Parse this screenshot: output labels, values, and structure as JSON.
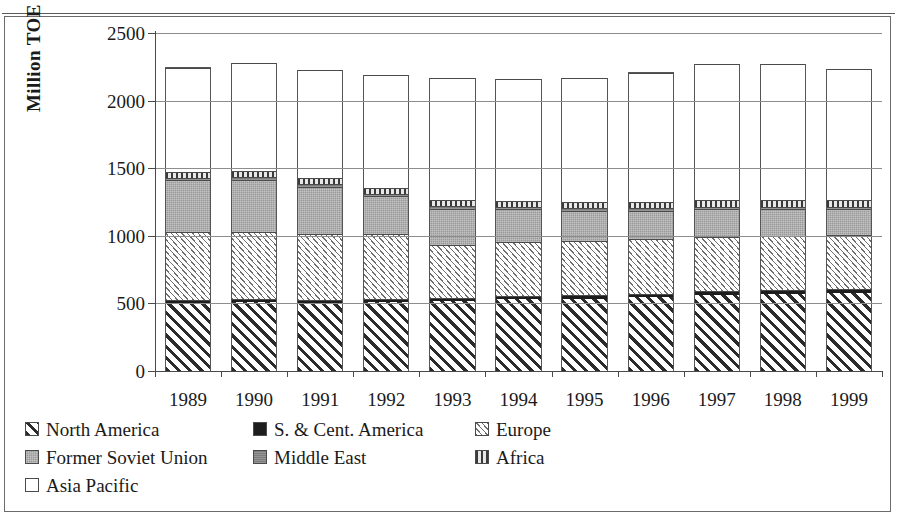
{
  "chart_data": {
    "type": "bar",
    "subtype": "stacked-vertical",
    "title": "",
    "xlabel": "",
    "ylabel": "Million TOE",
    "ylim": [
      0,
      2500
    ],
    "yticks": [
      0,
      500,
      1000,
      1500,
      2000,
      2500
    ],
    "grid": true,
    "legend_position": "bottom-left",
    "categories": [
      "1989",
      "1990",
      "1991",
      "1992",
      "1993",
      "1994",
      "1995",
      "1996",
      "1997",
      "1998",
      "1999"
    ],
    "series": [
      {
        "name": "North America",
        "key": "na",
        "pattern": "diagonal-hatch",
        "values": [
          505,
          512,
          505,
          512,
          515,
          530,
          535,
          545,
          562,
          572,
          580
        ]
      },
      {
        "name": "S. & Cent. America",
        "key": "sca",
        "pattern": "solid-black",
        "values": [
          22,
          22,
          22,
          24,
          24,
          25,
          26,
          27,
          28,
          28,
          28
        ]
      },
      {
        "name": "Europe",
        "key": "eur",
        "pattern": "fine-hatch",
        "values": [
          500,
          495,
          490,
          480,
          395,
          400,
          400,
          405,
          400,
          400,
          395
        ]
      },
      {
        "name": "Former Soviet Union",
        "key": "fsu",
        "pattern": "gray-stipple",
        "values": [
          385,
          385,
          345,
          275,
          265,
          240,
          225,
          210,
          205,
          195,
          195
        ]
      },
      {
        "name": "Middle East",
        "key": "me",
        "pattern": "medium-gray",
        "values": [
          18,
          18,
          18,
          18,
          18,
          18,
          18,
          18,
          18,
          18,
          18
        ]
      },
      {
        "name": "Africa",
        "key": "afr",
        "pattern": "vertical-stripe",
        "values": [
          45,
          48,
          45,
          42,
          45,
          45,
          45,
          48,
          50,
          50,
          52
        ]
      },
      {
        "name": "Asia Pacific",
        "key": "ap",
        "pattern": "white-empty",
        "values": [
          770,
          795,
          805,
          835,
          905,
          900,
          915,
          955,
          1010,
          1010,
          965
        ]
      }
    ],
    "totals": [
      2245,
      2275,
      2230,
      2186,
      2167,
      2158,
      2164,
      2208,
      2273,
      2273,
      2233
    ]
  },
  "legend": {
    "rows": [
      [
        {
          "label": "North America",
          "swatch": "diagonal-hatch"
        },
        {
          "label": "S. & Cent. America",
          "swatch": "solid-black"
        },
        {
          "label": "Europe",
          "swatch": "fine-hatch"
        }
      ],
      [
        {
          "label": "Former Soviet Union",
          "swatch": "gray-stipple"
        },
        {
          "label": "Middle East",
          "swatch": "medium-gray"
        },
        {
          "label": "Africa",
          "swatch": "vertical-stripe"
        }
      ],
      [
        {
          "label": "Asia Pacific",
          "swatch": "white-empty"
        }
      ]
    ]
  },
  "colors": {
    "axis": "#4a4a4a",
    "grid": "#8d8d8d",
    "frame": "#6b6b6b",
    "dark": "#1d1d1d",
    "gray_fsu": "#9a9a9a",
    "gray_me": "#7d7d7d"
  }
}
